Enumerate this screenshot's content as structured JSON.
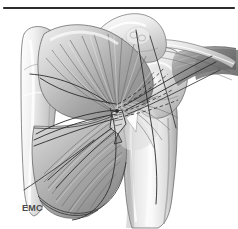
{
  "figure": {
    "domain_label": "medical-illustration",
    "background_color": "#ffffff",
    "width": 238,
    "height": 229,
    "signature": "EMC",
    "signature_color": "#4a4a4a",
    "rule": {
      "name": "top-horizontal-rule",
      "x1": 4,
      "y1": 8,
      "x2": 234,
      "y2": 8,
      "color": "#2b2b2b",
      "thickness": 2.2
    },
    "palette": {
      "outline": "#3a3a3a",
      "bone_light": "#f2f2f2",
      "bone_mid": "#cdcdcd",
      "bone_shadow": "#8f8f8f",
      "muscle_light": "#e0e0e0",
      "muscle_mid": "#b0b0b0",
      "muscle_dark": "#7d7d7d",
      "suture_dark": "#2f2f2f",
      "tendon_white": "#fafafa"
    },
    "structures": [
      {
        "name": "scapula-body",
        "label": "Scapula body"
      },
      {
        "name": "scapular-spine",
        "label": "Scapular spine"
      },
      {
        "name": "acromion",
        "label": "Acromion"
      },
      {
        "name": "greater-tuberosity",
        "label": "Greater tuberosity"
      },
      {
        "name": "humerus-shaft",
        "label": "Humerus shaft"
      },
      {
        "name": "infraspinatus-muscle",
        "label": "Infraspinatus"
      },
      {
        "name": "teres-minor-muscle",
        "label": "Teres minor"
      },
      {
        "name": "supraspinatus-tendon",
        "label": "Supraspinatus tendon"
      },
      {
        "name": "suture-threads",
        "label": "Suture threads"
      },
      {
        "name": "suture-anchor",
        "label": "Suture anchor"
      }
    ]
  }
}
